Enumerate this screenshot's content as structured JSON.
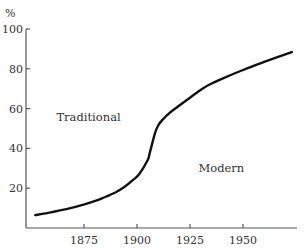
{
  "chart_data": {
    "type": "line",
    "title": "",
    "xlabel": "",
    "ylabel": "%",
    "xlim": [
      1847,
      1975
    ],
    "ylim": [
      0,
      100
    ],
    "x_ticks": [
      1875,
      1900,
      1925,
      1950
    ],
    "y_ticks": [
      20,
      40,
      60,
      80,
      100
    ],
    "grid": false,
    "legend": "none",
    "annotations": [
      {
        "text": "Traditional",
        "x": 1862,
        "y": 54
      },
      {
        "text": "Modern",
        "x": 1929,
        "y": 28
      }
    ],
    "series": [
      {
        "name": "modern share",
        "color": "#111111",
        "x": [
          1852,
          1860,
          1871,
          1880,
          1885,
          1890,
          1894,
          1898,
          1901,
          1905,
          1906,
          1908.5,
          1910,
          1912,
          1915,
          1919,
          1925,
          1930,
          1934,
          1940,
          1950,
          1960,
          1973
        ],
        "y": [
          6.5,
          8,
          10.6,
          13.5,
          15.6,
          18,
          20.6,
          24,
          27,
          34,
          37.7,
          47.7,
          51.5,
          54.3,
          57.5,
          60.8,
          65.5,
          69.3,
          72,
          75,
          79.4,
          83.5,
          88.4
        ]
      }
    ]
  }
}
